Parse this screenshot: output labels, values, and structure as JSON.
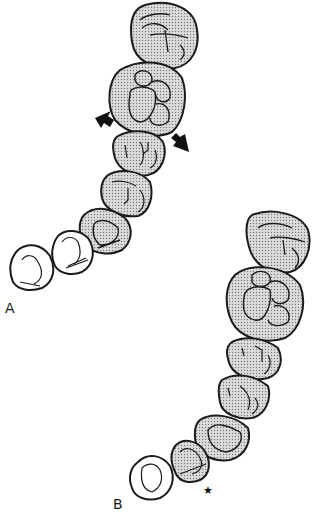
{
  "diagram": {
    "labels": {
      "a": "A",
      "b": "B",
      "star": "★"
    },
    "colors": {
      "outline": "#1a1a1a",
      "stipple": "#9a9a9a",
      "fill_bg": "#d8d8d8",
      "unshaded": "#ffffff",
      "arrow": "#111111"
    },
    "arches": [
      {
        "id": "A",
        "shaded_teeth": 6,
        "unshaded_teeth": 2,
        "arrows": 2
      },
      {
        "id": "B",
        "shaded_teeth": 6,
        "unshaded_teeth": 1,
        "marker": "star"
      }
    ]
  }
}
